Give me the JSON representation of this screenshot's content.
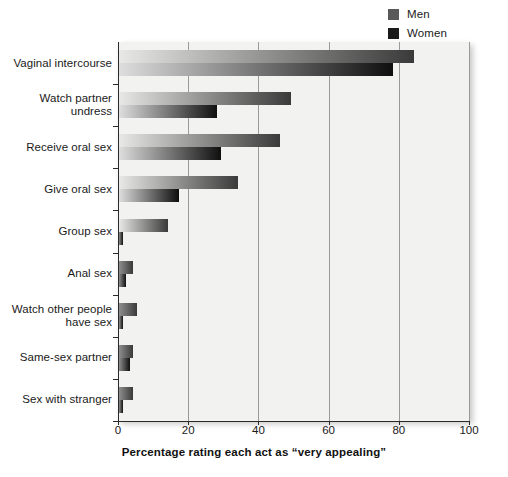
{
  "chart_data": {
    "type": "bar",
    "orientation": "horizontal",
    "title": "",
    "xlabel": "Percentage rating each act as “very appealing”",
    "ylabel": "",
    "xlim": [
      0,
      100
    ],
    "xticks": [
      0,
      20,
      40,
      60,
      80,
      100
    ],
    "xtick_labels": [
      "0",
      "20",
      "40",
      "60",
      "80",
      "100"
    ],
    "grid": "vertical",
    "legend_position": "top-right",
    "categories": [
      "Vaginal intercourse",
      "Watch partner undress",
      "Receive oral sex",
      "Give oral sex",
      "Group sex",
      "Anal sex",
      "Watch other people have sex",
      "Same-sex partner",
      "Sex with stranger"
    ],
    "category_lines": [
      [
        "Vaginal intercourse"
      ],
      [
        "Watch partner",
        "undress"
      ],
      [
        "Receive oral sex"
      ],
      [
        "Give oral sex"
      ],
      [
        "Group sex"
      ],
      [
        "Anal sex"
      ],
      [
        "Watch other people",
        "have sex"
      ],
      [
        "Same-sex partner"
      ],
      [
        "Sex with stranger"
      ]
    ],
    "series": [
      {
        "name": "Men",
        "values": [
          84,
          49,
          46,
          34,
          14,
          4,
          5,
          4,
          4
        ]
      },
      {
        "name": "Women",
        "values": [
          78,
          28,
          29,
          17,
          1,
          2,
          1,
          3,
          1
        ]
      }
    ]
  },
  "legend": {
    "items": [
      {
        "label": "Men",
        "color": "#595959"
      },
      {
        "label": "Women",
        "color": "#1a1a1a"
      }
    ]
  },
  "colors": {
    "plot_background": "#f2f2f0",
    "gridline": "#9a9a98",
    "axis": "#2a2a2a",
    "men_bar_start": "#e8e8e6",
    "men_bar_end": "#3a3a3a",
    "women_bar_start": "#dedede",
    "women_bar_end": "#0f0f0f",
    "text": "#1a1a1a"
  }
}
